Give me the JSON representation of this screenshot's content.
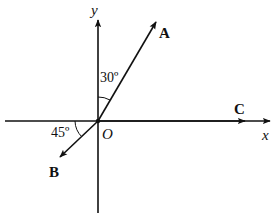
{
  "diagram": {
    "origin_label": "O",
    "axes": {
      "x_label": "x",
      "y_label": "y"
    },
    "vectors": [
      {
        "name": "A",
        "label": "A",
        "direction": "30° from +y axis toward +x"
      },
      {
        "name": "B",
        "label": "B",
        "direction": "45° below -x axis"
      },
      {
        "name": "C",
        "label": "C",
        "direction": "along +x axis"
      }
    ],
    "angles": [
      {
        "label": "30º",
        "between": "y-axis and A"
      },
      {
        "label": "45º",
        "between": "-x axis and B"
      }
    ],
    "colors": {
      "stroke": "#111111",
      "background": "#ffffff"
    }
  }
}
